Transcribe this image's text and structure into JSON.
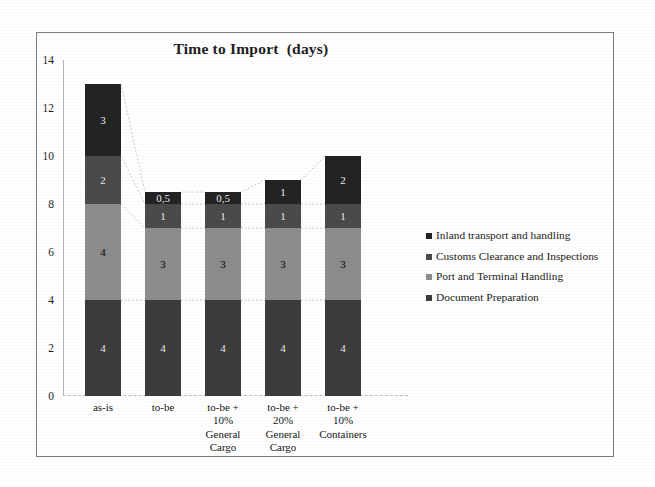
{
  "chart_data": {
    "type": "bar",
    "subtype": "stacked-bar",
    "title": "Time to Import  (days)",
    "xlabel": "",
    "ylabel": "",
    "ylim": [
      0,
      14
    ],
    "y_ticks": [
      0,
      2,
      4,
      6,
      8,
      10,
      12,
      14
    ],
    "grid": false,
    "legend_position": "right",
    "stack_order_bottom_to_top": [
      "Document Preparation",
      "Port and Terminal Handling",
      "Customs Clearance and Inspections",
      "Inland transport and handling"
    ],
    "categories": [
      "as-is",
      "to-be + 10% General Cargo",
      "to-be + 20% General Cargo",
      "to-be + 10% Containers",
      "to-be"
    ],
    "category_labels": [
      [
        "as-is"
      ],
      [
        "to-be"
      ],
      [
        "to-be +",
        "10%",
        "General",
        "Cargo"
      ],
      [
        "to-be +",
        "20%",
        "General",
        "Cargo"
      ],
      [
        "to-be +",
        "10%",
        "Containers"
      ]
    ],
    "series": [
      {
        "name": "Document Preparation",
        "color": "#3c3c3c",
        "values": [
          4,
          4,
          4,
          4,
          4
        ],
        "labels": [
          "4",
          "4",
          "4",
          "4",
          "4"
        ]
      },
      {
        "name": "Port and Terminal Handling",
        "color": "#8c8c8c",
        "values": [
          4,
          3,
          3,
          3,
          3
        ],
        "labels": [
          "4",
          "3",
          "3",
          "3",
          "3"
        ]
      },
      {
        "name": "Customs Clearance and Inspections",
        "color": "#4a4a4a",
        "values": [
          2,
          1,
          1,
          1,
          1
        ],
        "labels": [
          "2",
          "1",
          "1",
          "1",
          "1"
        ]
      },
      {
        "name": "Inland transport and handling",
        "color": "#232323",
        "values": [
          3,
          0.5,
          0.5,
          1,
          2
        ],
        "labels": [
          "3",
          "0,5",
          "0,5",
          "1",
          "2"
        ]
      }
    ],
    "totals": [
      13,
      8.5,
      8.5,
      9,
      10
    ]
  },
  "legend": {
    "items": [
      {
        "label": "Inland transport and handling",
        "color": "#232323"
      },
      {
        "label": "Customs Clearance and Inspections",
        "color": "#4a4a4a"
      },
      {
        "label": "Port and Terminal Handling",
        "color": "#8c8c8c"
      },
      {
        "label": "Document Preparation",
        "color": "#3c3c3c"
      }
    ]
  },
  "colors": {
    "frame": "#7c7c7c",
    "axis": "#b4b4b4",
    "connector": "#b0b0b0",
    "text": "#1b1b1b",
    "background": "#ffffff"
  }
}
